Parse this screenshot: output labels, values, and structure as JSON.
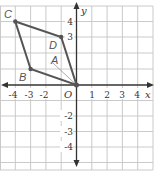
{
  "figure": {
    "type": "coordinate-plane",
    "axes": {
      "x_label": "x",
      "y_label": "y",
      "origin_label": "O",
      "x_ticks": [
        "-4",
        "-3",
        "-2",
        "1",
        "2",
        "3",
        "4"
      ],
      "y_ticks": [
        "4",
        "3",
        "-2",
        "-3",
        "-4"
      ],
      "x_range": [
        -5,
        5
      ],
      "y_range": [
        -5,
        5
      ]
    },
    "grid": {
      "on": true,
      "color": "#b8b8b8"
    },
    "polygon": {
      "name": "parallelogram",
      "color": "#555555",
      "vertices": [
        {
          "label": "C",
          "x": -4,
          "y": 4
        },
        {
          "label": "D",
          "x": -1,
          "y": 3
        },
        {
          "label": "O",
          "x": 0,
          "y": 0
        },
        {
          "label": "B",
          "x": -3,
          "y": 1
        }
      ]
    },
    "angle_label": "A",
    "labels": {
      "C": "C",
      "D": "D",
      "B": "B",
      "A": "A"
    }
  }
}
